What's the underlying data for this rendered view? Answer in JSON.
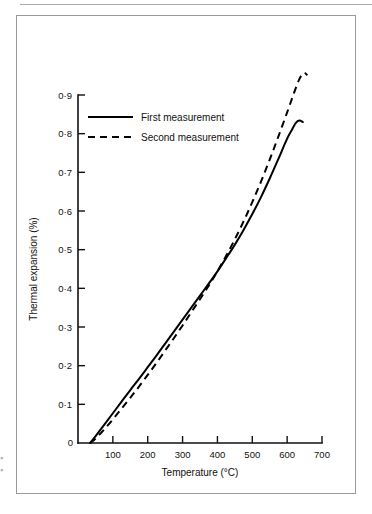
{
  "figure": {
    "frame_border_color": "#9a9a9a",
    "background_color": "#ffffff",
    "line_color": "#000000",
    "margin_fragment_top": "▪",
    "margin_fragment_bottom": "▪"
  },
  "chart_data": {
    "type": "line",
    "title": "",
    "subtitle": "",
    "xlabel": "Temperature (°C)",
    "ylabel": "Thermal expansion (%)",
    "xlim": [
      0,
      700
    ],
    "ylim": [
      0,
      0.9
    ],
    "grid": false,
    "legend_position": "upper-left-inside",
    "x_ticks": [
      0,
      100,
      200,
      300,
      400,
      500,
      600,
      700
    ],
    "x_tick_labels": [
      "0",
      "100",
      "200",
      "300",
      "400",
      "500",
      "600",
      "700"
    ],
    "y_ticks": [
      0,
      0.1,
      0.2,
      0.3,
      0.4,
      0.5,
      0.6,
      0.7,
      0.8,
      0.9
    ],
    "y_tick_labels": [
      "0",
      "0·1",
      "0·2",
      "0·3",
      "0·4",
      "0·5",
      "0·6",
      "0·7",
      "0·8",
      "0·9"
    ],
    "series": [
      {
        "name": "First measurement",
        "style": "solid",
        "x": [
          35,
          50,
          75,
          100,
          125,
          150,
          175,
          200,
          225,
          250,
          275,
          300,
          325,
          350,
          375,
          400,
          425,
          450,
          475,
          500,
          525,
          550,
          575,
          600,
          615,
          625,
          635,
          645
        ],
        "y": [
          0.0,
          0.017,
          0.047,
          0.077,
          0.107,
          0.137,
          0.166,
          0.196,
          0.226,
          0.257,
          0.288,
          0.319,
          0.35,
          0.381,
          0.412,
          0.444,
          0.478,
          0.513,
          0.551,
          0.592,
          0.636,
          0.684,
          0.735,
          0.787,
          0.812,
          0.828,
          0.834,
          0.83
        ]
      },
      {
        "name": "Second measurement",
        "style": "dashed",
        "x": [
          35,
          50,
          75,
          100,
          125,
          150,
          175,
          200,
          225,
          250,
          275,
          300,
          325,
          350,
          375,
          400,
          425,
          450,
          475,
          500,
          525,
          550,
          575,
          600,
          620,
          635,
          648,
          658
        ],
        "y": [
          0.0,
          0.011,
          0.035,
          0.061,
          0.089,
          0.117,
          0.146,
          0.176,
          0.207,
          0.239,
          0.271,
          0.304,
          0.338,
          0.372,
          0.407,
          0.444,
          0.484,
          0.527,
          0.573,
          0.623,
          0.676,
          0.733,
          0.793,
          0.855,
          0.906,
          0.941,
          0.957,
          0.951
        ]
      }
    ],
    "legend": [
      {
        "label": "First measurement",
        "style": "solid"
      },
      {
        "label": "Second measurement",
        "style": "dashed"
      }
    ]
  }
}
